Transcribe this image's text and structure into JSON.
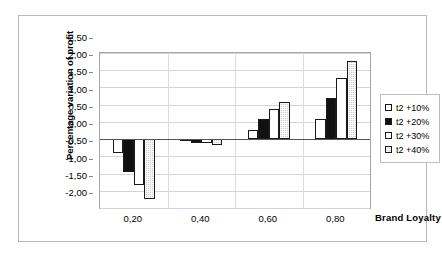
{
  "chart_data": {
    "type": "bar",
    "title": "",
    "subtitle": "",
    "xlabel": "Brand Loyalty",
    "ylabel": "Percentage variation of profit",
    "categories": [
      "0,20",
      "0,40",
      "0,60",
      "0,80"
    ],
    "series": [
      {
        "name": "t2 +10%",
        "fill": "white",
        "color": "#ffffff",
        "values": [
          -0.4,
          -0.03,
          0.27,
          0.58
        ]
      },
      {
        "name": "t2 +20%",
        "fill": "black",
        "color": "#111111",
        "values": [
          -0.95,
          -0.1,
          0.58,
          1.18
        ]
      },
      {
        "name": "t2 +30%",
        "fill": "white",
        "color": "#ffffff",
        "values": [
          -1.32,
          -0.12,
          0.86,
          1.78
        ]
      },
      {
        "name": "t2 +40%",
        "fill": "gray",
        "color": "#cfcfcf",
        "values": [
          -1.73,
          -0.18,
          1.07,
          2.28
        ]
      }
    ],
    "ylim": [
      -2.0,
      2.5
    ],
    "ytick_step": 0.5,
    "ytick_labels": [
      "2,50",
      "2,00",
      "1,50",
      "1,00",
      "0,50",
      "0,00",
      "-0,50",
      "-1,00",
      "-1,50",
      "-2,00"
    ],
    "ytick_values": [
      2.5,
      2.0,
      1.5,
      1.0,
      0.5,
      0.0,
      -0.5,
      -1.0,
      -1.5,
      -2.0
    ],
    "grid": true,
    "legend_position": "right",
    "decimal_separator": ","
  },
  "legend": {
    "items": [
      {
        "label": "t2 +10%"
      },
      {
        "label": "t2 +20%"
      },
      {
        "label": "t2 +30%"
      },
      {
        "label": "t2 +40%"
      }
    ]
  },
  "axes": {
    "x_title": "Brand Loyalty",
    "y_title": "Percentage variation of profit"
  }
}
